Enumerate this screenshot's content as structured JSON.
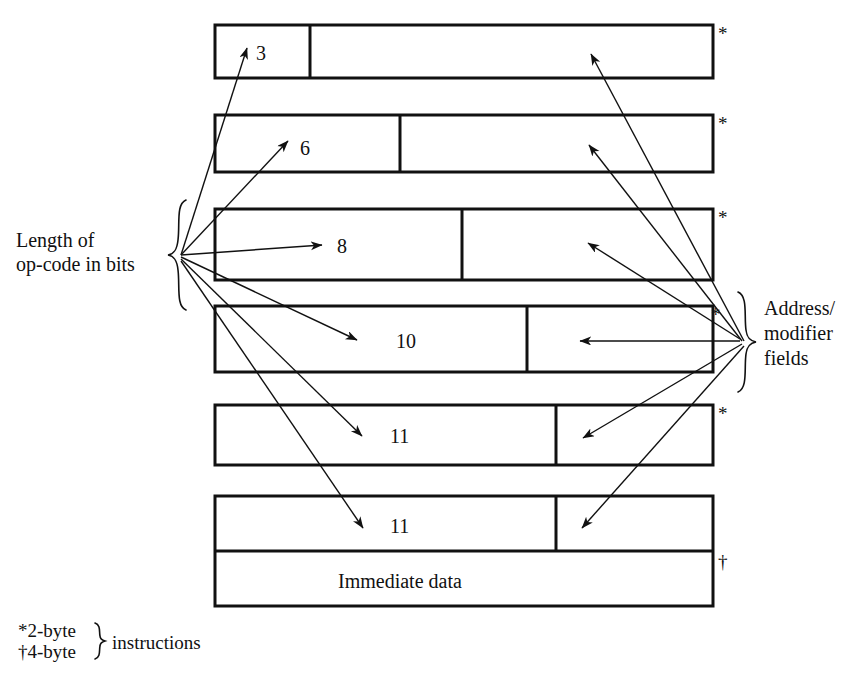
{
  "diagram": {
    "left_label": {
      "line1": "Length of",
      "line2": "op-code in bits"
    },
    "right_label": {
      "line1": "Address/",
      "line2": "modifier",
      "line3": "fields"
    },
    "rows": [
      {
        "id": "row-1",
        "opcode_bits": "3",
        "marker": "*",
        "field_label": ""
      },
      {
        "id": "row-2",
        "opcode_bits": "6",
        "marker": "*",
        "field_label": ""
      },
      {
        "id": "row-3",
        "opcode_bits": "8",
        "marker": "*",
        "field_label": ""
      },
      {
        "id": "row-4",
        "opcode_bits": "10",
        "marker": "*",
        "field_label": ""
      },
      {
        "id": "row-5",
        "opcode_bits": "11",
        "marker": "*",
        "field_label": ""
      },
      {
        "id": "row-6",
        "opcode_bits": "11",
        "marker": "†",
        "field_label": "Immediate data"
      }
    ],
    "legend": {
      "two_byte_marker": "*",
      "two_byte_text": "2-byte",
      "four_byte_marker": "†",
      "four_byte_text": "4-byte",
      "instructions_text": "instructions"
    },
    "colors": {
      "ink": "#111111",
      "paper": "#ffffff"
    }
  }
}
